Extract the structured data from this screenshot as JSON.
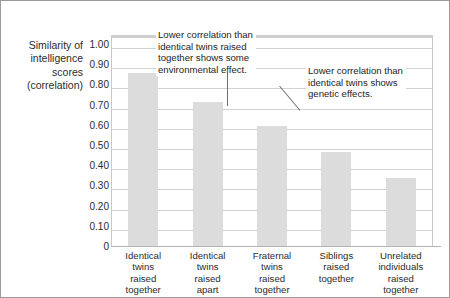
{
  "chart_data": {
    "type": "bar",
    "title": "",
    "subtitle": "",
    "xlabel": "",
    "ylabel": "Similarity of intelligence scores (correlation)",
    "ylabel_lines": [
      "Similarity of",
      "intelligence",
      "scores",
      "(correlation)"
    ],
    "categories": [
      "Identical twins raised together",
      "Identical twins raised apart",
      "Fraternal twins raised together",
      "Siblings raised together",
      "Unrelated individuals raised together"
    ],
    "category_lines": [
      [
        "Identical",
        "twins",
        "raised",
        "together"
      ],
      [
        "Identical",
        "twins",
        "raised",
        "apart"
      ],
      [
        "Fraternal",
        "twins",
        "raised",
        "together"
      ],
      [
        "Siblings",
        "raised",
        "together"
      ],
      [
        "Unrelated",
        "individuals",
        "raised",
        "together"
      ]
    ],
    "values": [
      0.86,
      0.72,
      0.6,
      0.47,
      0.34
    ],
    "ylim": [
      0,
      1.0
    ],
    "ytick_values": [
      1.0,
      0.9,
      0.8,
      0.7,
      0.6,
      0.5,
      0.4,
      0.3,
      0.2,
      0.1,
      0
    ],
    "ytick_labels": [
      "1.00",
      "0.90",
      "0.80",
      "0.70",
      "0.60",
      "0.50",
      "0.40",
      "0.30",
      "0.20",
      "0.10",
      "0"
    ],
    "grid": true,
    "legend": false,
    "bar_color": "#dcdcdc",
    "gridline_color": "#d2d2d2",
    "annotations": [
      {
        "id": "annotation-1",
        "text": "Lower correlation than identical twins raised together shows some environmental effect.",
        "lines": [
          "Lower correlation than",
          "identical twins raised",
          "together shows some",
          "environmental effect."
        ],
        "points_to_category": "Identical twins raised apart"
      },
      {
        "id": "annotation-2",
        "text": "Lower correlation than identical twins shows genetic effects.",
        "lines": [
          "Lower correlation than",
          "identical twins shows",
          "genetic effects."
        ],
        "points_to_category": "Fraternal twins raised together"
      }
    ]
  }
}
